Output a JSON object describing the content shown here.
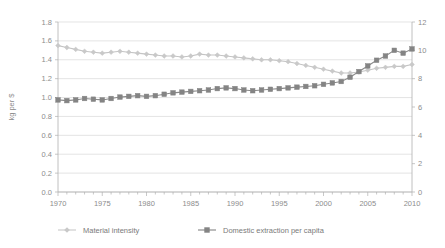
{
  "chart_data": {
    "type": "line",
    "title": "",
    "subtitle": "",
    "xlabel": "",
    "ylabel": "kg per $",
    "ylabel_right": "",
    "xlim": [
      1970,
      2010
    ],
    "ylim": [
      0.0,
      1.8
    ],
    "ylim_right": [
      0,
      12
    ],
    "grid": true,
    "legend_position": "bottom",
    "x": [
      1970,
      1971,
      1972,
      1973,
      1974,
      1975,
      1976,
      1977,
      1978,
      1979,
      1980,
      1981,
      1982,
      1983,
      1984,
      1985,
      1986,
      1987,
      1988,
      1989,
      1990,
      1991,
      1992,
      1993,
      1994,
      1995,
      1996,
      1997,
      1998,
      1999,
      2000,
      2001,
      2002,
      2003,
      2004,
      2005,
      2006,
      2007,
      2008,
      2009,
      2010
    ],
    "x_tick_labels": [
      "1970",
      "1975",
      "1980",
      "1985",
      "1990",
      "1995",
      "2000",
      "2005",
      "2010"
    ],
    "x_ticks": [
      1970,
      1975,
      1980,
      1985,
      1990,
      1995,
      2000,
      2005,
      2010
    ],
    "y_tick_labels": [
      "0.0",
      "0.2",
      "0.4",
      "0.6",
      "0.8",
      "1.0",
      "1.2",
      "1.4",
      "1.6",
      "1.8"
    ],
    "y_ticks": [
      0.0,
      0.2,
      0.4,
      0.6,
      0.8,
      1.0,
      1.2,
      1.4,
      1.6,
      1.8
    ],
    "y_right_tick_labels": [
      "0",
      "2",
      "4",
      "6",
      "8",
      "10",
      "12"
    ],
    "y_right_ticks": [
      0,
      2,
      4,
      6,
      8,
      10,
      12
    ],
    "series": [
      {
        "name": "Material intensity",
        "axis": "left",
        "color": "#c9c9c9",
        "marker": "diamond",
        "values": [
          1.55,
          1.53,
          1.51,
          1.49,
          1.48,
          1.47,
          1.48,
          1.49,
          1.48,
          1.47,
          1.46,
          1.45,
          1.44,
          1.44,
          1.43,
          1.44,
          1.46,
          1.45,
          1.45,
          1.44,
          1.43,
          1.42,
          1.41,
          1.4,
          1.4,
          1.39,
          1.38,
          1.36,
          1.34,
          1.32,
          1.3,
          1.28,
          1.26,
          1.26,
          1.27,
          1.29,
          1.31,
          1.32,
          1.33,
          1.33,
          1.35
        ]
      },
      {
        "name": "Domestic extraction per capita",
        "axis": "right",
        "color": "#848484",
        "marker": "square",
        "values": [
          6.5,
          6.45,
          6.5,
          6.6,
          6.55,
          6.5,
          6.6,
          6.7,
          6.75,
          6.8,
          6.75,
          6.8,
          6.9,
          7.0,
          7.05,
          7.1,
          7.15,
          7.2,
          7.3,
          7.35,
          7.3,
          7.2,
          7.15,
          7.2,
          7.25,
          7.3,
          7.35,
          7.4,
          7.45,
          7.5,
          7.6,
          7.7,
          7.8,
          8.1,
          8.5,
          8.9,
          9.3,
          9.6,
          10.0,
          9.8,
          10.1
        ]
      }
    ],
    "legend": [
      {
        "label": "Material intensity",
        "color": "#c9c9c9",
        "marker": "diamond"
      },
      {
        "label": "Domestic extraction per capita",
        "color": "#848484",
        "marker": "square"
      }
    ]
  }
}
